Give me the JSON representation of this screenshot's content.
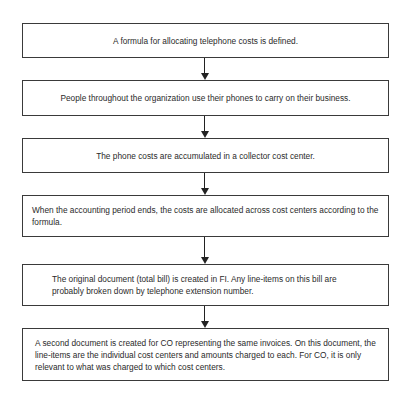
{
  "flowchart": {
    "steps": [
      {
        "text": "A formula for allocating telephone costs is defined."
      },
      {
        "text": "People throughout the organization use their phones to carry on their business."
      },
      {
        "text": "The phone costs are accumulated in a collector cost center."
      },
      {
        "text": "When the accounting period ends, the costs are allocated across cost centers according to the formula."
      },
      {
        "text": "The original document (total bill) is created in FI.  Any line-items on this bill are probably broken down by telephone extension number."
      },
      {
        "text": "A second document is created for CO representing the same invoices. On this document, the line-items are the individual cost centers and amounts charged to each. For CO, it is only relevant to what was charged to which cost centers."
      }
    ],
    "colors": {
      "border": "#3a3a3a",
      "arrow": "#222222",
      "text": "#2a2a2a",
      "background": "#ffffff"
    }
  }
}
